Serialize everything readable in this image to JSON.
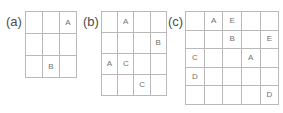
{
  "figure": {
    "background": "#ffffff",
    "grid_line_color": "#b9b9b9",
    "letter_color": "#707070",
    "label_color": "#4d4d4d",
    "watermark_text": ""
  },
  "panels": [
    {
      "id": "a",
      "label": "(a)",
      "rows": 3,
      "cols": 3,
      "cells": [
        [
          "",
          "",
          "A"
        ],
        [
          "",
          "",
          ""
        ],
        [
          "",
          "B",
          ""
        ]
      ]
    },
    {
      "id": "b",
      "label": "(b)",
      "rows": 4,
      "cols": 4,
      "cells": [
        [
          "",
          "A",
          "",
          ""
        ],
        [
          "",
          "",
          "",
          "B"
        ],
        [
          "A",
          "C",
          "",
          ""
        ],
        [
          "",
          "",
          "C",
          ""
        ]
      ]
    },
    {
      "id": "c",
      "label": "(c)",
      "rows": 5,
      "cols": 5,
      "cells": [
        [
          "",
          "A",
          "E",
          "",
          ""
        ],
        [
          "",
          "",
          "B",
          "",
          "E"
        ],
        [
          "C",
          "",
          "",
          "A",
          ""
        ],
        [
          "D",
          "",
          "",
          "",
          ""
        ],
        [
          "",
          "",
          "",
          "",
          "D"
        ]
      ]
    }
  ]
}
